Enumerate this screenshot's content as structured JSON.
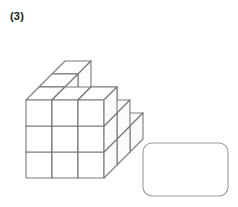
{
  "problem": {
    "label": "(3)",
    "type": "cube-counting"
  },
  "figure": {
    "name": "isometric-cube-stack",
    "projection": "isometric",
    "cube": {
      "face_width": 26,
      "face_height": 26,
      "depth_dx": 13,
      "depth_dy": -13
    },
    "origin": {
      "x": 26,
      "y": 178
    },
    "columns": 3,
    "rows": 3,
    "heightmap": [
      [
        3,
        3,
        3
      ],
      [
        3,
        2,
        2
      ],
      [
        3,
        2,
        1
      ]
    ],
    "total_cubes": 22,
    "colors": {
      "stroke": "#7a7a7a",
      "fill_top": "#ffffff",
      "fill_front": "#ffffff",
      "fill_side": "#fbfbfb"
    },
    "stroke_width": 1.1
  },
  "answer_box": {
    "label": "",
    "placeholder": "",
    "x": 143,
    "y": 143,
    "width": 85,
    "height": 53,
    "radius": 9,
    "stroke": "#9a9a9a",
    "fill": "#ffffff",
    "stroke_width": 1.1
  }
}
